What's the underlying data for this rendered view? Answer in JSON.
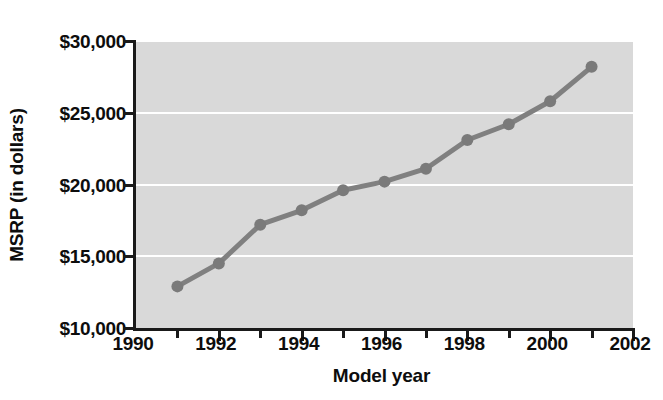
{
  "chart_data": {
    "type": "line",
    "title": "",
    "xlabel": "Model year",
    "ylabel": "MSRP (in dollars)",
    "x": [
      1991,
      1992,
      1993,
      1994,
      1995,
      1996,
      1997,
      1998,
      1999,
      2000,
      2001
    ],
    "values": [
      12900,
      14500,
      17200,
      18200,
      19600,
      20200,
      21100,
      23100,
      24200,
      25800,
      28200
    ],
    "series": [
      {
        "name": "MSRP",
        "values": [
          12900,
          14500,
          17200,
          18200,
          19600,
          20200,
          21100,
          23100,
          24200,
          25800,
          28200
        ]
      }
    ],
    "xlim": [
      1990,
      2002
    ],
    "ylim": [
      10000,
      30000
    ],
    "x_major_ticks": [
      1990,
      1992,
      1994,
      1996,
      1998,
      2000,
      2002
    ],
    "x_minor_ticks": [
      1991,
      1993,
      1995,
      1997,
      1999,
      2001
    ],
    "x_tick_labels": [
      "1990",
      "1992",
      "1994",
      "1996",
      "1998",
      "2000",
      "2002"
    ],
    "y_ticks": [
      10000,
      15000,
      20000,
      25000,
      30000
    ],
    "y_tick_labels": [
      "$10,000",
      "$15,000",
      "$20,000",
      "$25,000",
      "$30,000"
    ],
    "grid": true,
    "grid_axis": "y",
    "legend": false,
    "legend_position": "none",
    "colors": {
      "line": "#808080",
      "marker": "#7a7a7a",
      "plot_background": "#d9d9d9",
      "gridline": "#ffffff",
      "axis": "#1a1a1a",
      "text": "#0d0d0d",
      "figure_background": "#ffffff"
    },
    "line_width": 5,
    "marker_radius": 6,
    "marker_shape": "circle"
  }
}
